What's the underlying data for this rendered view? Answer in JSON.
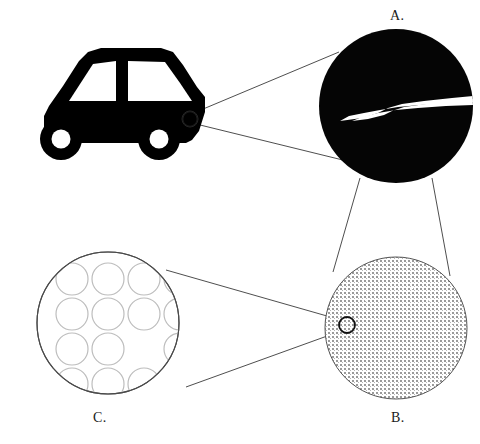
{
  "figure": {
    "background_color": "#ffffff",
    "width": 480,
    "height": 444
  },
  "labels": {
    "a": "A.",
    "b": "B.",
    "c": "C."
  },
  "colors": {
    "ink": "#000000",
    "label_text": "#1a1a1a",
    "leader_line": "#3a3a3a",
    "stipple_dot": "#8a8a8a",
    "stipple_fill": "#d8d8d8",
    "lattice_outline": "#bdbdbd",
    "circle_outline": "#2b2b2b",
    "crack_fill": "#ffffff"
  },
  "objects": {
    "car": {
      "name": "car-silhouette",
      "fill": "#000000",
      "body_points": "44,143 44,115 48,107 62,86 78,60 86,52 100,49 160,49 172,52 182,64 196,86 204,96 196,118 196,130 190,139 186,143",
      "windows": [
        {
          "name": "rear-window",
          "points": "68,102 92,63 116,60 116,102"
        },
        {
          "name": "front-window",
          "points": "127,60 166,61 180,82 192,102 127,102"
        }
      ],
      "wheels": [
        {
          "name": "rear-wheel",
          "cx": 61,
          "cy": 139,
          "r_outer": 20,
          "r_inner": 9
        },
        {
          "name": "front-wheel",
          "cx": 159,
          "cy": 139,
          "r_outer": 20,
          "r_inner": 9
        }
      ],
      "headlight": {
        "name": "headlight",
        "cx": 190,
        "cy": 119,
        "r": 8
      }
    },
    "circle_a": {
      "name": "magnified-crack-circle",
      "cx": 396,
      "cy": 106,
      "r": 77,
      "fill": "#050505",
      "contents": "crack",
      "crack_path": "M470,97 L441,100 L410,103 L392,107 L381,112 L355,119 L341,120 L355,115 L372,111 L392,108 L416,106 L444,104 L470,104 Z",
      "crack_fill": "#ffffff"
    },
    "circle_b": {
      "name": "magnified-grain-circle",
      "cx": 396,
      "cy": 328,
      "r": 71,
      "fill": "stipple",
      "outline": "#555555",
      "inclusion": {
        "name": "inclusion-circle",
        "cx": 347,
        "cy": 325,
        "r": 8,
        "stroke": "#111111"
      }
    },
    "circle_c": {
      "name": "magnified-lattice-circle",
      "cx": 108,
      "cy": 323,
      "r": 71,
      "outline": "#4a4a4a",
      "lattice": {
        "rows": 4,
        "cols": 4,
        "atom_radius": 16,
        "spacing_x": 36,
        "spacing_y": 35,
        "origin_x": 72,
        "origin_y": 279,
        "vacancy": {
          "row": 2,
          "col": 2,
          "description": "missing-atom-vacancy"
        }
      }
    }
  },
  "leader_lines": [
    {
      "name": "leader-car-to-a-upper",
      "from": [
        196,
        112
      ],
      "to": [
        339,
        52
      ]
    },
    {
      "name": "leader-car-to-a-lower",
      "from": [
        196,
        124
      ],
      "to": [
        355,
        163
      ]
    },
    {
      "name": "leader-a-to-b-left",
      "from": [
        360,
        178
      ],
      "to": [
        333,
        272
      ]
    },
    {
      "name": "leader-a-to-b-right",
      "from": [
        432,
        178
      ],
      "to": [
        450,
        276
      ]
    },
    {
      "name": "leader-b-to-c-upper",
      "from": [
        341,
        320
      ],
      "to": [
        166,
        270
      ]
    },
    {
      "name": "leader-b-to-c-lower",
      "from": [
        341,
        331
      ],
      "to": [
        186,
        387
      ]
    }
  ]
}
